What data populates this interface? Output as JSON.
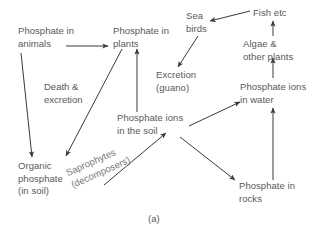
{
  "figure": {
    "caption": "(a)",
    "nodes": [
      {
        "id": "phosphate-in-animals",
        "label": "Phosphate in\nanimals",
        "x": 18,
        "y": 25
      },
      {
        "id": "phosphate-in-plants",
        "label": "Phosphate in\nplants",
        "x": 113,
        "y": 25
      },
      {
        "id": "sea-birds",
        "label": "Sea\nbirds",
        "x": 186,
        "y": 10
      },
      {
        "id": "fish-etc",
        "label": "Fish etc",
        "x": 253,
        "y": 7
      },
      {
        "id": "algae-other-plants",
        "label": "Algae &\nother plants",
        "x": 243,
        "y": 38
      },
      {
        "id": "excretion-guano",
        "label": "Excretion\n(guano)",
        "x": 156,
        "y": 69
      },
      {
        "id": "phosphate-ions-in-water",
        "label": "Phosphate ions\nin water",
        "x": 240,
        "y": 81
      },
      {
        "id": "phosphate-ions-in-the-soil",
        "label": "Phosphate ions\nin the soil",
        "x": 117,
        "y": 112
      },
      {
        "id": "organic-phosphate-in-soil",
        "label": "Organic\nphosphate\n(in soil)",
        "x": 18,
        "y": 160
      },
      {
        "id": "phosphate-in-rocks",
        "label": "Phosphate in\nrocks",
        "x": 239,
        "y": 180
      }
    ],
    "edge_labels": [
      {
        "id": "death-and-excretion",
        "label": "Death &\nexcretion",
        "x": 44,
        "y": 81
      }
    ],
    "rotated_labels": [
      {
        "id": "saprophytes-decomposers",
        "label": "Saprophytes\n(decomposers)",
        "x": 64,
        "y": 168,
        "rotation": -24
      }
    ],
    "arrows": [
      {
        "id": "animals-to-plants",
        "x1": 66,
        "y1": 46,
        "x2": 108,
        "y2": 46
      },
      {
        "id": "animals-to-organic-phosphate",
        "x1": 21,
        "y1": 53,
        "x2": 32,
        "y2": 157
      },
      {
        "id": "plants-to-organic-phosphate",
        "x1": 122,
        "y1": 49,
        "x2": 66,
        "y2": 156
      },
      {
        "id": "soil-ions-to-plants",
        "x1": 137,
        "y1": 112,
        "x2": 137,
        "y2": 49
      },
      {
        "id": "organic-phosphate-to-soil-ions",
        "x1": 104,
        "y1": 185,
        "x2": 166,
        "y2": 133
      },
      {
        "id": "soil-ions-to-water-ions",
        "x1": 189,
        "y1": 126,
        "x2": 240,
        "y2": 102
      },
      {
        "id": "soil-ions-to-rocks",
        "x1": 180,
        "y1": 137,
        "x2": 235,
        "y2": 180
      },
      {
        "id": "rocks-to-water-ions",
        "x1": 273,
        "y1": 180,
        "x2": 273,
        "y2": 108
      },
      {
        "id": "water-ions-to-algae",
        "x1": 273,
        "y1": 78,
        "x2": 273,
        "y2": 58
      },
      {
        "id": "algae-to-fish",
        "x1": 273,
        "y1": 36,
        "x2": 273,
        "y2": 21
      },
      {
        "id": "fish-to-sea-birds",
        "x1": 250,
        "y1": 11,
        "x2": 210,
        "y2": 21
      },
      {
        "id": "sea-birds-to-excretion",
        "x1": 198,
        "y1": 36,
        "x2": 178,
        "y2": 67
      }
    ],
    "colors": {
      "text": "#58585a",
      "arrow": "#3a3a3c",
      "background": "#ffffff"
    }
  }
}
